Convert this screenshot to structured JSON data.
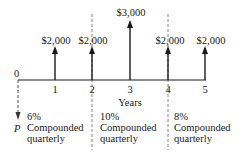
{
  "diagram": {
    "type": "cash-flow-timeline",
    "axis_label": "Years",
    "origin_label": "0",
    "present_value_label": "P",
    "periods": [
      {
        "year": "1",
        "amount": "$2,000"
      },
      {
        "year": "2",
        "amount": "$2,000"
      },
      {
        "year": "3",
        "amount": "$3,000"
      },
      {
        "year": "4",
        "amount": "$2,000"
      },
      {
        "year": "5",
        "amount": "$2,000"
      }
    ],
    "rate_segments": [
      {
        "rate": "6%",
        "line1": "Compounded",
        "line2": "quarterly"
      },
      {
        "rate": "10%",
        "line1": "Compounded",
        "line2": "quarterly"
      },
      {
        "rate": "8%",
        "line1": "Compounded",
        "line2": "quarterly"
      }
    ],
    "colors": {
      "line": "#1a1a1a",
      "dashed": "#555555",
      "background": "#ffffff"
    }
  }
}
